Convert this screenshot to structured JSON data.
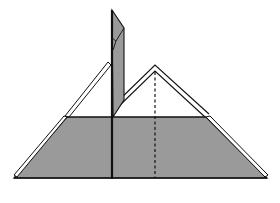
{
  "diagram": {
    "type": "origami-fold-step",
    "colors": {
      "background": "#ffffff",
      "paper_colored": "#9a9a9a",
      "paper_white": "#ffffff",
      "stroke": "#111111"
    },
    "elements": {
      "base_trapezoid": {
        "points": "14,178 67,117 206,117 267,178"
      },
      "left_flap_layer": {
        "points": "14,176 17,174 67,117 64,117"
      },
      "right_flap_layer": {
        "points": "206,117 209,117 267,174 264,176"
      },
      "left_white_strip": {
        "points": "65,115 108,62 112,65 70,117"
      },
      "right_white_triangle_outer": {
        "points": "113,104 155,65 209,113 204,117 155,72 118,107"
      },
      "vertical_pole": {
        "points": "112,10 124,28 124,100 113,117"
      },
      "pole_inner_fold": {
        "points": "112,10 124,28 116,45 112,50"
      },
      "center_crease": {
        "x1": 112,
        "y1": 117,
        "x2": 112,
        "y2": 178
      },
      "valley_fold_dashed": {
        "x1": 155,
        "y1": 72,
        "x2": 155,
        "y2": 178
      }
    }
  }
}
